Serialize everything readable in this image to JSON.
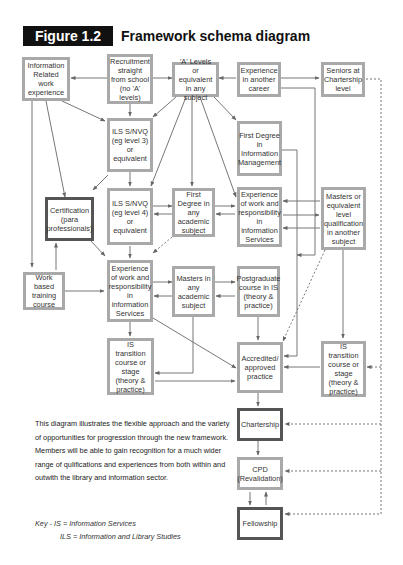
{
  "header": {
    "figure_label": "Figure 1.2",
    "title": "Framework schema diagram"
  },
  "nodes": {
    "info_related": "Information Related work experience",
    "recruitment": "Recruitment straight from school (no 'A' levels)",
    "a_levels": "'A' Levels or equivalent in any subject",
    "exp_career": "Experience in another career",
    "seniors": "Seniors at Chartership level",
    "ils3": "ILS S/NVQ (eg level 3) or equivalent",
    "first_degree_im": "First Degree in Information Management",
    "certification": "Certification (para professionals)",
    "ils4": "ILS S/NVQ (eg level 4) or equivalent",
    "first_degree_any": "First Degree in any academic subject",
    "exp_work_top": "Experience of work and responsibility in information Services",
    "masters_equiv": "Masters or equivalent level qualification in another subject",
    "work_based": "Work based training course",
    "exp_work_mid": "Experience of work and responsibility in information Services",
    "masters_any": "Masters in any academic subject",
    "postgrad": "Postgraduate course in IS (theory & practice)",
    "is_transition_left": "IS transition course or stage (theory & practice)",
    "accredited": "Accredited/ approved practice",
    "is_transition_right": "IS transition course or stage (theory & practice)",
    "chartership": "Chartership",
    "cpd": "CPD (Revalidation)",
    "fellowship": "Fellowship"
  },
  "description": "This diagram illustrates the flexible approach and the variety of opportunities for progression through the new framework. Members will be able to gain recognition for a much wider range of qulifications and experiences from both within and outwith the library and information sector.",
  "key": {
    "line1": "Key - IS = Information Services",
    "line2": "ILS = Information and Library Studies"
  },
  "colors": {
    "box_border": "#a9a9a9",
    "bold_border": "#555555",
    "arrow": "#666666",
    "label_bg": "#111111"
  }
}
